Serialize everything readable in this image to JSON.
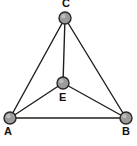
{
  "figure": {
    "type": "graph-diagram",
    "background_color": "#ffffff",
    "caption": "",
    "width": 137,
    "height": 146
  },
  "style": {
    "node_fill": "#9b9b9b",
    "node_stroke": "#2b2724",
    "edge_color": "#221e1b",
    "label_color": "#15120f",
    "node_radius": 6,
    "edge_width": 1.4
  },
  "chart_data": {
    "type": "diagram",
    "title": "",
    "nodes": [
      {
        "id": "C",
        "label": "C",
        "x": 65,
        "y": 18,
        "label_x": 62,
        "label_y": -2
      },
      {
        "id": "E",
        "label": "E",
        "x": 63,
        "y": 83,
        "label_x": 59,
        "label_y": 92
      },
      {
        "id": "A",
        "label": "A",
        "x": 10,
        "y": 118,
        "label_x": 4,
        "label_y": 126
      },
      {
        "id": "B",
        "label": "B",
        "x": 126,
        "y": 118,
        "label_x": 122,
        "label_y": 126
      }
    ],
    "edges": [
      {
        "from": "C",
        "to": "A"
      },
      {
        "from": "C",
        "to": "B"
      },
      {
        "from": "C",
        "to": "E"
      },
      {
        "from": "A",
        "to": "B"
      },
      {
        "from": "A",
        "to": "E"
      },
      {
        "from": "E",
        "to": "B"
      }
    ]
  }
}
